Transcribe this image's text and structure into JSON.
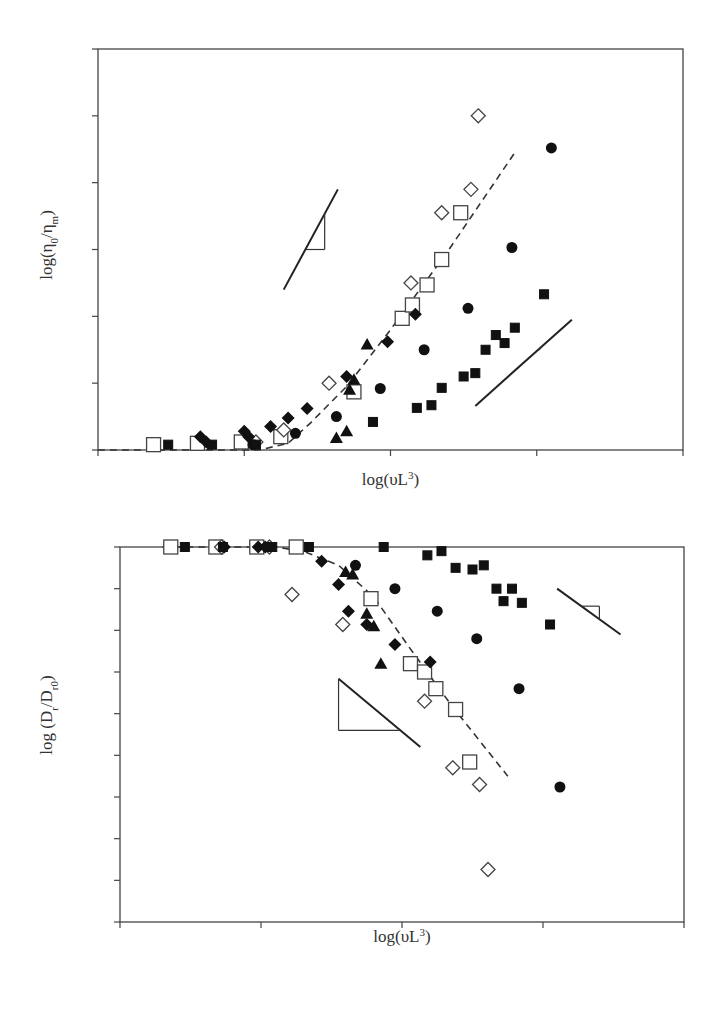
{
  "figure": {
    "panels": [
      "(a)",
      "(b)"
    ]
  },
  "chart_data": [
    {
      "type": "scatter",
      "panel_label": "(a)",
      "title": "",
      "xlabel": "log(υL³)",
      "ylabel": "log(η₀/ηm)",
      "xlim": [
        0,
        4
      ],
      "ylim": [
        0,
        6
      ],
      "xticks": [
        "0",
        "1",
        "2",
        "3",
        "4"
      ],
      "yticks": [
        "0",
        "1",
        "2",
        "3",
        "4",
        "5",
        "6"
      ],
      "grid": false,
      "legend": "none",
      "series": [
        {
          "name": "open squares",
          "marker": "square-open",
          "points": [
            [
              0.38,
              0.08
            ],
            [
              0.68,
              0.1
            ],
            [
              0.98,
              0.12
            ],
            [
              1.25,
              0.2
            ],
            [
              1.75,
              0.87
            ],
            [
              2.08,
              1.97
            ],
            [
              2.15,
              2.17
            ],
            [
              2.25,
              2.47
            ],
            [
              2.35,
              2.85
            ],
            [
              2.48,
              3.55
            ]
          ]
        },
        {
          "name": "open diamonds",
          "marker": "diamond-open",
          "points": [
            [
              1.08,
              0.12
            ],
            [
              1.27,
              0.3
            ],
            [
              1.58,
              1.0
            ],
            [
              2.14,
              2.5
            ],
            [
              2.35,
              3.55
            ],
            [
              2.55,
              3.9
            ],
            [
              2.6,
              5.0
            ]
          ]
        },
        {
          "name": "filled diamonds",
          "marker": "diamond-filled",
          "points": [
            [
              0.7,
              0.2
            ],
            [
              0.74,
              0.12
            ],
            [
              1.0,
              0.28
            ],
            [
              1.03,
              0.2
            ],
            [
              1.18,
              0.35
            ],
            [
              1.3,
              0.48
            ],
            [
              1.43,
              0.62
            ],
            [
              1.7,
              1.1
            ],
            [
              1.98,
              1.62
            ],
            [
              2.17,
              2.03
            ]
          ]
        },
        {
          "name": "filled circles",
          "marker": "circle-filled",
          "points": [
            [
              1.06,
              0.08
            ],
            [
              1.35,
              0.25
            ],
            [
              1.63,
              0.5
            ],
            [
              1.93,
              0.92
            ],
            [
              2.23,
              1.5
            ],
            [
              2.53,
              2.12
            ],
            [
              2.83,
              3.03
            ],
            [
              3.1,
              4.52
            ]
          ]
        },
        {
          "name": "filled triangles",
          "marker": "triangle-filled",
          "points": [
            [
              1.63,
              0.18
            ],
            [
              1.7,
              0.28
            ],
            [
              1.72,
              0.9
            ],
            [
              1.75,
              1.05
            ],
            [
              1.84,
              1.58
            ]
          ]
        },
        {
          "name": "filled squares",
          "marker": "square-filled",
          "points": [
            [
              0.48,
              0.08
            ],
            [
              0.78,
              0.08
            ],
            [
              1.08,
              0.08
            ],
            [
              1.88,
              0.42
            ],
            [
              2.18,
              0.63
            ],
            [
              2.28,
              0.67
            ],
            [
              2.35,
              0.93
            ],
            [
              2.5,
              1.1
            ],
            [
              2.58,
              1.15
            ],
            [
              2.65,
              1.5
            ],
            [
              2.72,
              1.72
            ],
            [
              2.78,
              1.6
            ],
            [
              2.85,
              1.83
            ],
            [
              3.05,
              2.33
            ]
          ]
        }
      ],
      "lines": [
        {
          "name": "dashed fit",
          "style": "dashed",
          "points": [
            [
              0,
              0
            ],
            [
              1.1,
              0
            ],
            [
              1.3,
              0.1
            ],
            [
              1.45,
              0.4
            ],
            [
              1.7,
              0.95
            ],
            [
              2.0,
              1.8
            ],
            [
              2.4,
              3.0
            ],
            [
              2.85,
              4.45
            ]
          ]
        }
      ],
      "annotations": [
        {
          "type": "slope-triangle",
          "slope_label": "3",
          "line": [
            [
              1.27,
              2.4
            ],
            [
              1.64,
              3.9
            ]
          ],
          "corner": [
            1.55,
            3.0
          ]
        },
        {
          "type": "slope-triangle",
          "slope_label": "2",
          "line": [
            [
              2.58,
              0.66
            ],
            [
              3.24,
              1.95
            ]
          ],
          "corner": [
            3.02,
            1.5
          ]
        }
      ]
    },
    {
      "type": "scatter",
      "panel_label": "(b)",
      "title": "",
      "xlabel": "log(υL³)",
      "ylabel": "log (Dr/Dr0)",
      "xlim": [
        0,
        4
      ],
      "ylim": [
        -4.5,
        0.0
      ],
      "xticks": [
        "0",
        "1",
        "2",
        "3",
        "4"
      ],
      "yticks": [
        "0.0",
        "−0.5",
        "−1.0",
        "−1.5",
        "−2.0",
        "−2.5",
        "−3.0",
        "−3.5",
        "−4.0",
        "−4.5"
      ],
      "grid": false,
      "legend": "none",
      "series": [
        {
          "name": "open squares",
          "marker": "square-open",
          "points": [
            [
              0.36,
              0.0
            ],
            [
              0.68,
              0.0
            ],
            [
              0.97,
              0.0
            ],
            [
              1.25,
              0.0
            ],
            [
              1.78,
              -0.62
            ],
            [
              2.06,
              -1.4
            ],
            [
              2.16,
              -1.5
            ],
            [
              2.24,
              -1.7
            ],
            [
              2.38,
              -1.95
            ],
            [
              2.48,
              -2.58
            ]
          ]
        },
        {
          "name": "open diamonds",
          "marker": "diamond-open",
          "points": [
            [
              0.72,
              0.0
            ],
            [
              1.06,
              0.0
            ],
            [
              1.22,
              -0.57
            ],
            [
              1.58,
              -0.93
            ],
            [
              2.16,
              -1.85
            ],
            [
              2.36,
              -2.65
            ],
            [
              2.55,
              -2.85
            ],
            [
              2.61,
              -3.87
            ]
          ]
        },
        {
          "name": "filled diamonds",
          "marker": "diamond-filled",
          "points": [
            [
              0.74,
              0.0
            ],
            [
              0.98,
              0.0
            ],
            [
              1.03,
              0.0
            ],
            [
              1.43,
              -0.17
            ],
            [
              1.55,
              -0.45
            ],
            [
              1.62,
              -0.77
            ],
            [
              1.75,
              -0.93
            ],
            [
              1.95,
              -1.17
            ],
            [
              2.2,
              -1.38
            ]
          ]
        },
        {
          "name": "filled circles",
          "marker": "circle-filled",
          "points": [
            [
              1.67,
              -0.22
            ],
            [
              1.95,
              -0.5
            ],
            [
              2.25,
              -0.77
            ],
            [
              2.53,
              -1.1
            ],
            [
              2.83,
              -1.7
            ],
            [
              3.12,
              -2.88
            ]
          ]
        },
        {
          "name": "filled triangles",
          "marker": "triangle-filled",
          "points": [
            [
              1.6,
              -0.3
            ],
            [
              1.65,
              -0.33
            ],
            [
              1.75,
              -0.8
            ],
            [
              1.8,
              -0.95
            ],
            [
              1.85,
              -1.4
            ]
          ]
        },
        {
          "name": "filled squares",
          "marker": "square-filled",
          "points": [
            [
              0.46,
              0.0
            ],
            [
              0.73,
              0.0
            ],
            [
              1.08,
              0.0
            ],
            [
              1.34,
              0.0
            ],
            [
              1.87,
              0.0
            ],
            [
              2.18,
              -0.1
            ],
            [
              2.28,
              -0.05
            ],
            [
              2.38,
              -0.25
            ],
            [
              2.5,
              -0.27
            ],
            [
              2.58,
              -0.22
            ],
            [
              2.67,
              -0.5
            ],
            [
              2.72,
              -0.65
            ],
            [
              2.78,
              -0.5
            ],
            [
              2.85,
              -0.67
            ],
            [
              3.05,
              -0.93
            ]
          ]
        }
      ],
      "lines": [
        {
          "name": "dashed fit",
          "style": "dashed",
          "points": [
            [
              0.3,
              0.0
            ],
            [
              1.1,
              0.0
            ],
            [
              1.3,
              -0.05
            ],
            [
              1.55,
              -0.22
            ],
            [
              1.8,
              -0.6
            ],
            [
              2.05,
              -1.2
            ],
            [
              2.35,
              -1.9
            ],
            [
              2.75,
              -2.75
            ]
          ]
        }
      ],
      "annotations": [
        {
          "type": "slope-triangle",
          "slope_label": "−1",
          "line": [
            [
              3.1,
              -0.5
            ],
            [
              3.55,
              -1.05
            ]
          ],
          "corner": [
            3.4,
            -0.71
          ]
        },
        {
          "type": "slope-triangle",
          "slope_label": "−2",
          "line": [
            [
              1.55,
              -1.58
            ],
            [
              2.13,
              -2.4
            ]
          ],
          "corner": [
            1.55,
            -2.2
          ]
        }
      ]
    }
  ]
}
